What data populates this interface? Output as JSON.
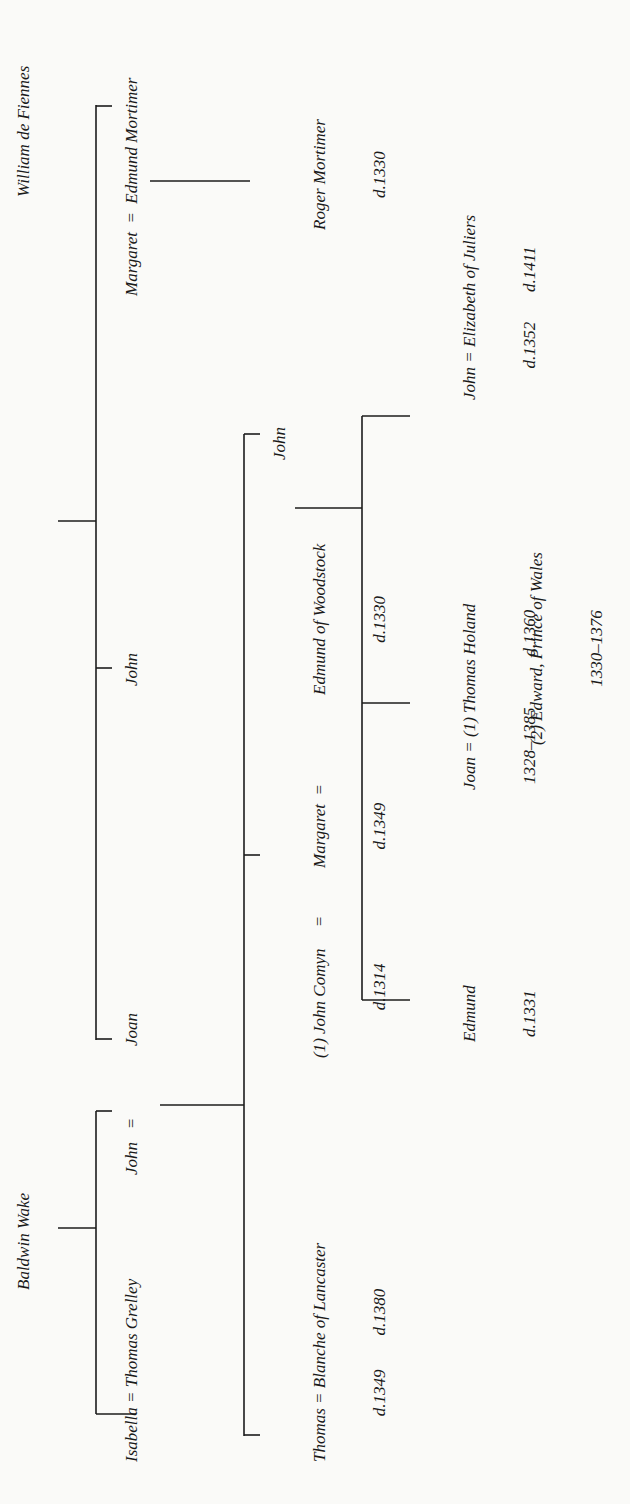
{
  "diagram": {
    "type": "genealogy-tree",
    "orientation": "rotated-90-ccw",
    "line_color": "#1c1c1c",
    "background": "#fafaf8"
  },
  "gen1": {
    "william": "William de Fiennes",
    "baldwin": "Baldwin Wake"
  },
  "gen2": {
    "margaret_mortimer": "Margaret  =  Edmund Mortimer",
    "john_fiennes": "John",
    "joan": "Joan",
    "john_wake_eq": "John   =",
    "isabella": "Isabella = Thomas Grelley"
  },
  "gen3": {
    "roger": {
      "name": "Roger Mortimer",
      "dates": "d.1330"
    },
    "john": "John",
    "edmund_woodstock": {
      "name": "Edmund of Woodstock",
      "dates": "d.1330"
    },
    "margaret": {
      "name": "Margaret  =",
      "dates": "d.1349"
    },
    "john_comyn": {
      "name": "(1) John Comyn     =",
      "dates": "d.1314"
    },
    "thomas": {
      "name": "Thomas = Blanche of Lancaster",
      "dates": "d.1349        d.1380"
    }
  },
  "gen4": {
    "john_elizabeth": {
      "name": "John = Elizabeth of Juliers",
      "dates": "d.1352       d.1411"
    },
    "joan_holand": {
      "name": "Joan = (1) Thomas Holand",
      "dates": "1328–1385            d.1360"
    },
    "edward": {
      "name": "(2) Edward, Prince of Wales",
      "dates": "1330–1376"
    },
    "edmund": {
      "name": "Edmund",
      "dates": "d.1331"
    }
  }
}
